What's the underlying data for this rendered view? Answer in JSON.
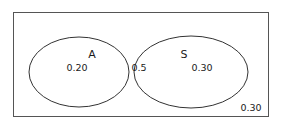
{
  "diagram": {
    "type": "venn",
    "universe": {
      "outside_value": "0.30"
    },
    "sets": [
      {
        "name": "A",
        "only_value": "0.20"
      },
      {
        "name": "S",
        "only_value": "0.30"
      }
    ],
    "intersection_value": "0.5",
    "colors": {
      "stroke": "#333333",
      "background": "#ffffff"
    }
  }
}
